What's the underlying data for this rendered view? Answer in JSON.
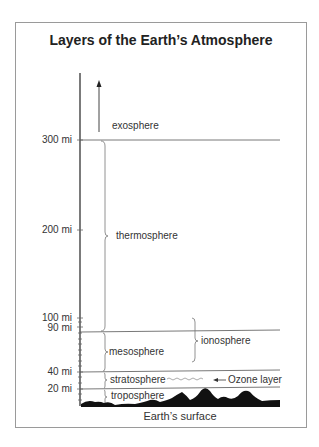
{
  "title": "Layers of the Earth’s Atmosphere",
  "axis": {
    "ticks": [
      {
        "label": "300 mi",
        "value": 300
      },
      {
        "label": "200 mi",
        "value": 200
      },
      {
        "label": "100 mi",
        "value": 100
      },
      {
        "label": "90 mi",
        "value": 90
      },
      {
        "label": "40 mi",
        "value": 40
      },
      {
        "label": "20 mi",
        "value": 20
      }
    ]
  },
  "layers": {
    "exosphere": "exosphere",
    "thermosphere": "thermosphere",
    "mesosphere": "mesosphere",
    "stratosphere": "stratosphere",
    "troposphere": "troposphere",
    "ionosphere": "ionosphere"
  },
  "annotations": {
    "ozone": "Ozone layer"
  },
  "ground_label": "Earth’s surface",
  "colors": {
    "line": "#555555",
    "axis": "#222222",
    "ground": "#111111",
    "frame": "#9a9a9a"
  }
}
